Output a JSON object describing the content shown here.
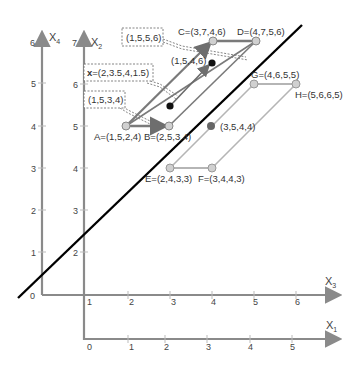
{
  "diagram": {
    "title": "",
    "axes": {
      "x4": {
        "label": "X",
        "sub": "4",
        "ticks": [
          "0",
          "1",
          "2",
          "3",
          "4",
          "5",
          "6"
        ]
      },
      "x2": {
        "label": "X",
        "sub": "2",
        "ticks": [
          "2",
          "3",
          "4",
          "5",
          "6",
          "7"
        ]
      },
      "x3": {
        "label": "X",
        "sub": "3",
        "ticks": [
          "1",
          "2",
          "3",
          "4",
          "5",
          "6"
        ]
      },
      "x1": {
        "label": "X",
        "sub": "1",
        "ticks": [
          "0",
          "1",
          "2",
          "3",
          "4",
          "5"
        ]
      }
    },
    "points": {
      "A": "A=(1,5,2,4)",
      "B": "B=(2,5,3,4)",
      "C": "C=(3,7,4,6)",
      "D": "D=(4,7,5,6)",
      "E": "E=(2,4,3,3)",
      "F": "F=(3,4,4,3)",
      "G": "G=(4,6,5,5)",
      "H": "H=(5,6,6,5)",
      "center_lower": "(3,5,4,4)",
      "inner_point": "(1,5,4,6)"
    },
    "callouts": {
      "c1": "(1,5,5,6)",
      "c2_prefix": "x",
      "c2_rest": "=(2,3.5,4,1.5)",
      "c3": "(1,5,3,4)"
    },
    "colors": {
      "axis": "#8a8a8a",
      "upper_shape": "#7a7a7a",
      "lower_shape": "#b5b5b5",
      "separator_line": "#000000",
      "node_fill": "#cfcfcf"
    }
  }
}
